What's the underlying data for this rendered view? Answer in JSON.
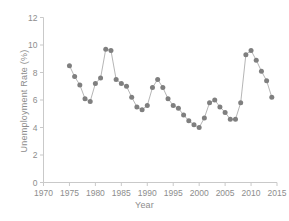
{
  "chart_data": {
    "type": "line",
    "title": "",
    "xlabel": "Year",
    "ylabel": "Unemployment Rate (%)",
    "xlim": [
      1970,
      2015
    ],
    "ylim": [
      0,
      12
    ],
    "xticks": [
      1970,
      1975,
      1980,
      1985,
      1990,
      1995,
      2000,
      2005,
      2010,
      2015
    ],
    "xtick_labels": [
      "1970",
      "1975",
      "1980",
      "1985",
      "1990",
      "1995",
      "2000",
      "2005",
      "2010",
      "2015"
    ],
    "yticks": [
      0,
      2,
      4,
      6,
      8,
      10,
      12
    ],
    "ytick_labels": [
      "0",
      "2",
      "4",
      "6",
      "8",
      "10",
      "12"
    ],
    "grid": false,
    "legend": "none",
    "marker": "circle",
    "marker_color": "#7f7f7f",
    "line_color": "#a2a2a2",
    "x": [
      1975,
      1976,
      1977,
      1978,
      1979,
      1980,
      1981,
      1982,
      1983,
      1984,
      1985,
      1986,
      1987,
      1988,
      1989,
      1990,
      1991,
      1992,
      1993,
      1994,
      1995,
      1996,
      1997,
      1998,
      1999,
      2000,
      2001,
      2002,
      2003,
      2004,
      2005,
      2006,
      2007,
      2008,
      2009,
      2010,
      2011,
      2012,
      2013,
      2014
    ],
    "values": [
      8.5,
      7.7,
      7.1,
      6.1,
      5.9,
      7.2,
      7.6,
      9.7,
      9.6,
      7.5,
      7.2,
      7.0,
      6.2,
      5.5,
      5.3,
      5.6,
      6.9,
      7.5,
      6.9,
      6.1,
      5.6,
      5.4,
      4.9,
      4.5,
      4.2,
      4.0,
      4.7,
      5.8,
      6.0,
      5.5,
      5.1,
      4.6,
      4.6,
      5.8,
      9.3,
      9.6,
      8.9,
      8.1,
      7.4,
      6.2
    ]
  }
}
